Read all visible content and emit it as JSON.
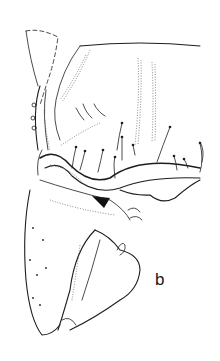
{
  "figure": {
    "type": "scientific-line-illustration",
    "panel_label": "b",
    "ink_color": "#1e1e1e",
    "background_color": "#ffffff"
  }
}
